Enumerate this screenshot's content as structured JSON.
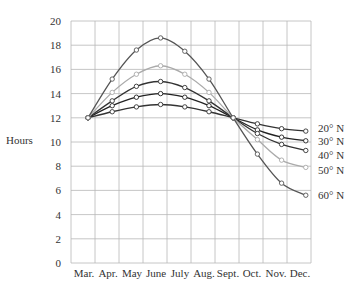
{
  "chart_data": {
    "type": "line",
    "title": "",
    "xlabel": "",
    "ylabel": "Hours",
    "ylim": [
      0,
      20
    ],
    "yticks": [
      0,
      2,
      4,
      6,
      8,
      10,
      12,
      14,
      16,
      18,
      20
    ],
    "grid": true,
    "legend_position": "right (inline labels at line ends)",
    "categories": [
      "Mar.",
      "Apr.",
      "May",
      "June",
      "July",
      "Aug.",
      "Sept.",
      "Oct.",
      "Nov.",
      "Dec."
    ],
    "series": [
      {
        "name": "20° N",
        "color": "#333333",
        "values": [
          12.0,
          12.5,
          12.9,
          13.1,
          12.9,
          12.5,
          12.0,
          11.5,
          11.1,
          10.9
        ]
      },
      {
        "name": "30° N",
        "color": "#222222",
        "values": [
          12.0,
          13.0,
          13.7,
          14.0,
          13.7,
          13.0,
          12.0,
          11.0,
          10.4,
          10.1
        ]
      },
      {
        "name": "40° N",
        "color": "#333333",
        "values": [
          12.0,
          13.4,
          14.6,
          15.0,
          14.5,
          13.4,
          12.0,
          10.7,
          9.8,
          9.3
        ]
      },
      {
        "name": "50° N",
        "color": "#aaaaaa",
        "values": [
          12.0,
          14.1,
          15.6,
          16.3,
          15.6,
          14.1,
          12.0,
          10.2,
          8.5,
          7.9
        ]
      },
      {
        "name": "60° N",
        "color": "#555555",
        "values": [
          12.0,
          15.2,
          17.6,
          18.6,
          17.5,
          15.2,
          12.0,
          9.0,
          6.6,
          5.6
        ]
      }
    ]
  }
}
